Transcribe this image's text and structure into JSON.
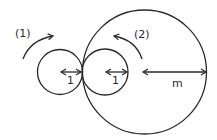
{
  "diagram": {
    "colors": {
      "stroke": "#2a2a2a",
      "background": "#ffffff"
    },
    "circles": [
      {
        "id": "small-left",
        "cx": 60,
        "cy": 72,
        "r": 22.5
      },
      {
        "id": "small-middle",
        "cx": 105,
        "cy": 72,
        "r": 23
      },
      {
        "id": "large",
        "cx": 144.5,
        "cy": 72,
        "r": 62
      }
    ],
    "rotation_arrows": [
      {
        "id": "arrow-1",
        "label": "(1)",
        "direction": "clockwise"
      },
      {
        "id": "arrow-2",
        "label": "(2)",
        "direction": "counterclockwise"
      }
    ],
    "radius_labels": {
      "small_left": "1",
      "small_middle": "1",
      "large": "m"
    }
  }
}
